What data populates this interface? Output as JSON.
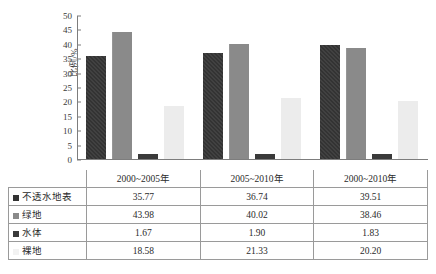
{
  "chart_data": {
    "type": "bar",
    "title": "",
    "xlabel": "",
    "ylabel": "比例/%",
    "ylim": [
      0,
      50
    ],
    "yticks": [
      0,
      5,
      10,
      15,
      20,
      25,
      30,
      35,
      40,
      45,
      50
    ],
    "grid": false,
    "legend_position": "table",
    "categories": [
      "2000~2005年",
      "2005~2010年",
      "2000~2010年"
    ],
    "series": [
      {
        "name": "不透水地表",
        "color": "#333333",
        "values": [
          35.77,
          36.74,
          39.51
        ]
      },
      {
        "name": "绿地",
        "color": "#8a8a8a",
        "values": [
          43.98,
          40.02,
          38.46
        ]
      },
      {
        "name": "水体",
        "color": "#3a3a3a",
        "values": [
          1.67,
          1.9,
          1.83
        ]
      },
      {
        "name": "裸地",
        "color": "#ececec",
        "values": [
          18.58,
          21.33,
          20.2
        ]
      }
    ]
  },
  "table": {
    "column_headers": [
      "2000~2005年",
      "2005~2010年",
      "2000~2010年"
    ],
    "rows": [
      {
        "label": "不透水地表",
        "values": [
          "35.77",
          "36.74",
          "39.51"
        ]
      },
      {
        "label": "绿地",
        "values": [
          "43.98",
          "40.02",
          "38.46"
        ]
      },
      {
        "label": "水体",
        "values": [
          "1.67",
          "1.90",
          "1.83"
        ]
      },
      {
        "label": "裸地",
        "values": [
          "18.58",
          "21.33",
          "20.20"
        ]
      }
    ]
  }
}
